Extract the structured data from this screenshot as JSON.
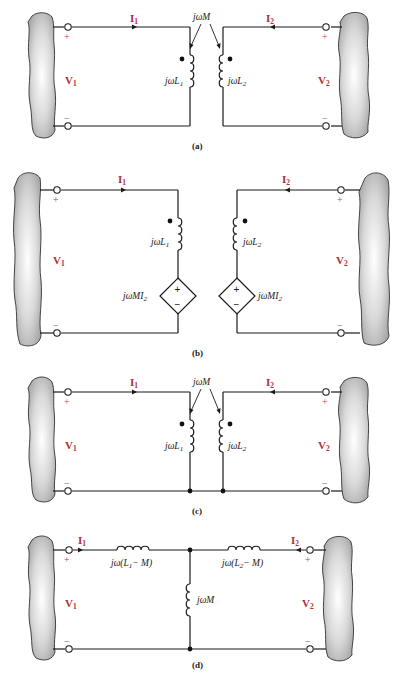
{
  "figure": {
    "panels": [
      {
        "id": "a",
        "caption": "(a)",
        "current_left": "I",
        "current_left_sub": "1",
        "current_right": "I",
        "current_right_sub": "2",
        "voltage_left": "V",
        "voltage_left_sub": "1",
        "voltage_right": "V",
        "voltage_right_sub": "2",
        "plus": "+",
        "minus": "−",
        "mutual_label": "jωM",
        "coil_left_label": "jωL",
        "coil_left_sub": "1",
        "coil_right_label": "jωL",
        "coil_right_sub": "2"
      },
      {
        "id": "b",
        "caption": "(b)",
        "current_left": "I",
        "current_left_sub": "1",
        "current_right": "I",
        "current_right_sub": "2",
        "voltage_left": "V",
        "voltage_left_sub": "1",
        "voltage_right": "V",
        "voltage_right_sub": "2",
        "plus": "+",
        "minus": "−",
        "coil_left_label": "jωL",
        "coil_left_sub": "1",
        "coil_right_label": "jωL",
        "coil_right_sub": "2",
        "source_left_label": "jωMI",
        "source_left_sub": "2",
        "source_right_label": "jωMI",
        "source_right_sub": "2"
      },
      {
        "id": "c",
        "caption": "(c)",
        "current_left": "I",
        "current_left_sub": "1",
        "current_right": "I",
        "current_right_sub": "2",
        "voltage_left": "V",
        "voltage_left_sub": "1",
        "voltage_right": "V",
        "voltage_right_sub": "2",
        "plus": "+",
        "minus": "−",
        "mutual_label": "jωM",
        "coil_left_label": "jωL",
        "coil_left_sub": "1",
        "coil_right_label": "jωL",
        "coil_right_sub": "2"
      },
      {
        "id": "d",
        "caption": "(d)",
        "current_left": "I",
        "current_left_sub": "1",
        "current_right": "I",
        "current_right_sub": "2",
        "voltage_left": "V",
        "voltage_left_sub": "1",
        "voltage_right": "V",
        "voltage_right_sub": "2",
        "plus": "+",
        "minus": "−",
        "series_left_pre": "jω(L",
        "series_left_sub": "1",
        "series_left_post": "− M)",
        "series_right_pre": "jω(L",
        "series_right_sub": "2",
        "series_right_post": "− M)",
        "shunt_label": "jωM"
      }
    ]
  }
}
